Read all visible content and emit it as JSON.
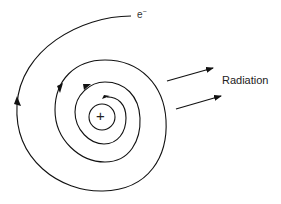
{
  "diagram": {
    "electron_label": "e",
    "electron_charge": "−",
    "nucleus_symbol": "+",
    "radiation_label": "Radiation",
    "stroke_color": "#111111"
  }
}
